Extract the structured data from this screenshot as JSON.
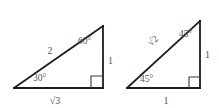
{
  "figure": {
    "background_color": "#ffffff",
    "line_color": "#1c1c1c",
    "label_color": "#555555"
  },
  "triangles": [
    {
      "id": "triangle-30-60-90",
      "name": "30-60-90 triangle",
      "vertices": {
        "bottom_left": [
          14,
          88
        ],
        "bottom_right": [
          103,
          88
        ],
        "top_right": [
          103,
          26
        ]
      },
      "right_angle_vertex": "bottom_right",
      "labels": {
        "hypotenuse": "2",
        "base": "√3",
        "base_radicand": "3",
        "vertical_leg": "1",
        "angle_bottom_left": "30°",
        "angle_top_right": "60°"
      }
    },
    {
      "id": "triangle-45-45-90",
      "name": "45-45-90 triangle",
      "vertices": {
        "bottom_left": [
          127,
          88
        ],
        "bottom_right": [
          200,
          88
        ],
        "top_right": [
          200,
          21
        ]
      },
      "right_angle_vertex": "bottom_right",
      "labels": {
        "hypotenuse": "√2",
        "hypotenuse_radicand": "2",
        "base": "1",
        "vertical_leg": "1",
        "angle_bottom_left": "45°",
        "angle_top_right": "45°"
      }
    }
  ]
}
